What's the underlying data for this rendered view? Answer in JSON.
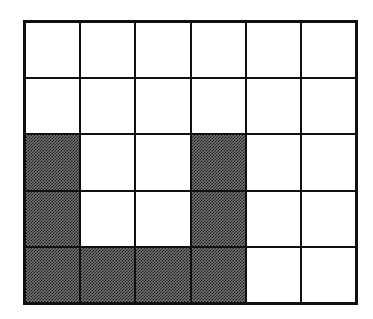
{
  "figure": {
    "canvas": {
      "width_px": 373,
      "height_px": 319,
      "background_color": "#ffffff"
    },
    "grid": {
      "columns": 6,
      "rows": 5,
      "total_cells": 30,
      "shaded_cell_count": 10,
      "unshaded_cell_count": 20,
      "line_color": "#101010",
      "outer_border_width_px": 3,
      "inner_line_width_px": 2,
      "cell_fill_color": "#ffffff",
      "shaded_fill_color": "#8a8a8a",
      "shaded_fill_style": "checkerboard-halftone"
    },
    "cells": [
      {
        "row": 1,
        "col": 1,
        "shaded": false,
        "name": "cell-r1c1"
      },
      {
        "row": 1,
        "col": 2,
        "shaded": false,
        "name": "cell-r1c2"
      },
      {
        "row": 1,
        "col": 3,
        "shaded": false,
        "name": "cell-r1c3"
      },
      {
        "row": 1,
        "col": 4,
        "shaded": false,
        "name": "cell-r1c4"
      },
      {
        "row": 1,
        "col": 5,
        "shaded": false,
        "name": "cell-r1c5"
      },
      {
        "row": 1,
        "col": 6,
        "shaded": false,
        "name": "cell-r1c6"
      },
      {
        "row": 2,
        "col": 1,
        "shaded": false,
        "name": "cell-r2c1"
      },
      {
        "row": 2,
        "col": 2,
        "shaded": false,
        "name": "cell-r2c2"
      },
      {
        "row": 2,
        "col": 3,
        "shaded": false,
        "name": "cell-r2c3"
      },
      {
        "row": 2,
        "col": 4,
        "shaded": false,
        "name": "cell-r2c4"
      },
      {
        "row": 2,
        "col": 5,
        "shaded": false,
        "name": "cell-r2c5"
      },
      {
        "row": 2,
        "col": 6,
        "shaded": false,
        "name": "cell-r2c6"
      },
      {
        "row": 3,
        "col": 1,
        "shaded": true,
        "name": "cell-r3c1"
      },
      {
        "row": 3,
        "col": 2,
        "shaded": false,
        "name": "cell-r3c2"
      },
      {
        "row": 3,
        "col": 3,
        "shaded": false,
        "name": "cell-r3c3"
      },
      {
        "row": 3,
        "col": 4,
        "shaded": true,
        "name": "cell-r3c4"
      },
      {
        "row": 3,
        "col": 5,
        "shaded": false,
        "name": "cell-r3c5"
      },
      {
        "row": 3,
        "col": 6,
        "shaded": false,
        "name": "cell-r3c6"
      },
      {
        "row": 4,
        "col": 1,
        "shaded": true,
        "name": "cell-r4c1"
      },
      {
        "row": 4,
        "col": 2,
        "shaded": false,
        "name": "cell-r4c2"
      },
      {
        "row": 4,
        "col": 3,
        "shaded": false,
        "name": "cell-r4c3"
      },
      {
        "row": 4,
        "col": 4,
        "shaded": true,
        "name": "cell-r4c4"
      },
      {
        "row": 4,
        "col": 5,
        "shaded": false,
        "name": "cell-r4c5"
      },
      {
        "row": 4,
        "col": 6,
        "shaded": false,
        "name": "cell-r4c6"
      },
      {
        "row": 5,
        "col": 1,
        "shaded": true,
        "name": "cell-r5c1"
      },
      {
        "row": 5,
        "col": 2,
        "shaded": true,
        "name": "cell-r5c2"
      },
      {
        "row": 5,
        "col": 3,
        "shaded": true,
        "name": "cell-r5c3"
      },
      {
        "row": 5,
        "col": 4,
        "shaded": true,
        "name": "cell-r5c4"
      },
      {
        "row": 5,
        "col": 5,
        "shaded": false,
        "name": "cell-r5c5"
      },
      {
        "row": 5,
        "col": 6,
        "shaded": false,
        "name": "cell-r5c6"
      }
    ]
  }
}
